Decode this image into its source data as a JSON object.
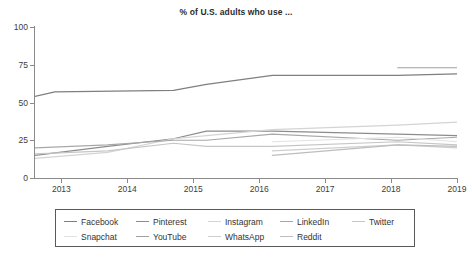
{
  "chart": {
    "title": "% of U.S. adults who use ..."
  },
  "chart_data": {
    "type": "line",
    "title": "% of U.S. adults who use ...",
    "xlabel": "",
    "ylabel": "",
    "xlim": [
      2012.6,
      2019.0
    ],
    "ylim": [
      0,
      100
    ],
    "grid": false,
    "legend_position": "below-plot",
    "xticks": [
      "2013",
      "2014",
      "2015",
      "2016",
      "2017",
      "2018",
      "2019"
    ],
    "yticks": [
      "0",
      "25",
      "50",
      "75",
      "100"
    ],
    "series": [
      {
        "name": "Facebook",
        "color": "#7f7f7f",
        "x": [
          2012.6,
          2012.9,
          2014.7,
          2015.2,
          2016.2,
          2018.1,
          2019.0
        ],
        "values": [
          54,
          57,
          58,
          62,
          68,
          68,
          69
        ]
      },
      {
        "name": "Pinterest",
        "color": "#8c8c8c",
        "x": [
          2012.6,
          2013.7,
          2014.7,
          2015.2,
          2016.2,
          2018.1,
          2019.0
        ],
        "values": [
          15,
          21,
          26,
          31,
          31,
          29,
          28
        ]
      },
      {
        "name": "Instagram",
        "color": "#d4d4d4",
        "x": [
          2012.6,
          2013.7,
          2014.7,
          2015.2,
          2016.2,
          2018.1,
          2019.0
        ],
        "values": [
          13,
          17,
          26,
          28,
          32,
          35,
          37
        ]
      },
      {
        "name": "LinkedIn",
        "color": "#a8a8a8",
        "x": [
          2012.6,
          2013.7,
          2014.7,
          2015.2,
          2016.2,
          2018.1,
          2019.0
        ],
        "values": [
          20,
          22,
          25,
          25,
          29,
          25,
          27
        ]
      },
      {
        "name": "Twitter",
        "color": "#c6c6c6",
        "x": [
          2012.6,
          2013.7,
          2014.7,
          2015.2,
          2016.2,
          2018.1,
          2019.0
        ],
        "values": [
          16,
          18,
          23,
          21,
          21,
          24,
          22
        ]
      },
      {
        "name": "Snapchat",
        "color": "#e2e2e2",
        "x": [
          2016.2,
          2018.1,
          2019.0
        ],
        "values": [
          24,
          27,
          24
        ]
      },
      {
        "name": "YouTube",
        "color": "#a0a0a0",
        "x": [
          2018.1,
          2019.0
        ],
        "values": [
          73,
          73
        ]
      },
      {
        "name": "WhatsApp",
        "color": "#cfcfcf",
        "x": [
          2016.2,
          2018.1,
          2019.0
        ],
        "values": [
          18,
          22,
          20
        ]
      },
      {
        "name": "Reddit",
        "color": "#bdbdbd",
        "x": [
          2016.2,
          2018.1,
          2019.0
        ],
        "values": [
          15,
          22,
          21
        ]
      }
    ]
  },
  "legend": {
    "rows": [
      [
        {
          "label": "Facebook",
          "color": "#7f7f7f"
        },
        {
          "label": "Pinterest",
          "color": "#8c8c8c"
        },
        {
          "label": "Instagram",
          "color": "#d4d4d4"
        },
        {
          "label": "LinkedIn",
          "color": "#a8a8a8"
        },
        {
          "label": "Twitter",
          "color": "#c6c6c6"
        }
      ],
      [
        {
          "label": "Snapchat",
          "color": "#e2e2e2"
        },
        {
          "label": "YouTube",
          "color": "#a0a0a0"
        },
        {
          "label": "WhatsApp",
          "color": "#cfcfcf"
        },
        {
          "label": "Reddit",
          "color": "#bdbdbd"
        }
      ]
    ]
  }
}
